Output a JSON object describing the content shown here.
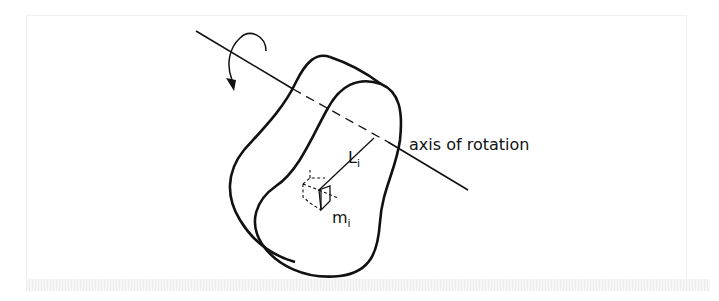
{
  "diagram": {
    "labels": {
      "axis": "axis of rotation",
      "distance": "L",
      "distance_sub": "i",
      "mass": "m",
      "mass_sub": "i"
    },
    "colors": {
      "stroke": "#111111",
      "background": "#ffffff"
    }
  }
}
